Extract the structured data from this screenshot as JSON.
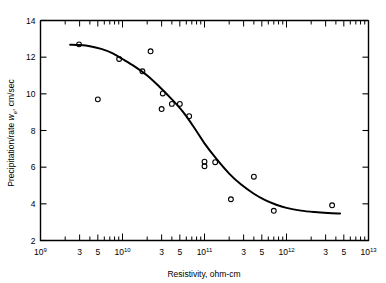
{
  "chart_data": {
    "type": "scatter",
    "title": "",
    "xlabel": "Resistivity, ohm-cm",
    "ylabel_prefix": "Precipitation/rate ",
    "ylabel_symbol": "w",
    "ylabel_subscript": "e",
    "ylabel_suffix": ", cm/sec",
    "ylabel_full": "Precipitation/rate we, cm/sec",
    "xscale": "log",
    "yscale": "linear",
    "xlim": [
      1000000000,
      10000000000000
    ],
    "ylim": [
      2,
      14
    ],
    "grid": false,
    "legend": null,
    "x_decade_labels": [
      "10",
      "10",
      "10",
      "10",
      "10"
    ],
    "x_decade_exponents": [
      "9",
      "10",
      "11",
      "12",
      "13"
    ],
    "x_minor_labels": [
      "3",
      "5"
    ],
    "y_tick_labels": [
      "2",
      "4",
      "6",
      "8",
      "10",
      "12",
      "14"
    ],
    "y_ticks": [
      2,
      4,
      6,
      8,
      10,
      12,
      14
    ],
    "points": [
      {
        "x": 2950000000.0,
        "y": 12.7
      },
      {
        "x": 5000000000.0,
        "y": 9.7
      },
      {
        "x": 9100000000.0,
        "y": 11.9
      },
      {
        "x": 17500000000.0,
        "y": 11.23
      },
      {
        "x": 22000000000.0,
        "y": 12.32
      },
      {
        "x": 30000000000.0,
        "y": 9.17
      },
      {
        "x": 31000000000.0,
        "y": 10.02
      },
      {
        "x": 40000000000.0,
        "y": 9.45
      },
      {
        "x": 50000000000.0,
        "y": 9.45
      },
      {
        "x": 65000000000.0,
        "y": 8.78
      },
      {
        "x": 100000000000.0,
        "y": 6.05
      },
      {
        "x": 100000000000.0,
        "y": 6.3
      },
      {
        "x": 135000000000.0,
        "y": 6.27
      },
      {
        "x": 210000000000.0,
        "y": 4.25
      },
      {
        "x": 400000000000.0,
        "y": 5.48
      },
      {
        "x": 700000000000.0,
        "y": 3.62
      },
      {
        "x": 3600000000000.0,
        "y": 3.92
      }
    ],
    "fit_curve": [
      {
        "x": 2300000000.0,
        "y": 12.68
      },
      {
        "x": 3000000000.0,
        "y": 12.66
      },
      {
        "x": 4000000000.0,
        "y": 12.6
      },
      {
        "x": 5500000000.0,
        "y": 12.45
      },
      {
        "x": 7500000000.0,
        "y": 12.22
      },
      {
        "x": 10000000000.0,
        "y": 11.9
      },
      {
        "x": 14000000000.0,
        "y": 11.5
      },
      {
        "x": 20000000000.0,
        "y": 11.0
      },
      {
        "x": 28000000000.0,
        "y": 10.4
      },
      {
        "x": 40000000000.0,
        "y": 9.7
      },
      {
        "x": 55000000000.0,
        "y": 9.0
      },
      {
        "x": 75000000000.0,
        "y": 8.15
      },
      {
        "x": 100000000000.0,
        "y": 7.3
      },
      {
        "x": 140000000000.0,
        "y": 6.45
      },
      {
        "x": 200000000000.0,
        "y": 5.65
      },
      {
        "x": 280000000000.0,
        "y": 5.05
      },
      {
        "x": 400000000000.0,
        "y": 4.55
      },
      {
        "x": 550000000000.0,
        "y": 4.2
      },
      {
        "x": 750000000000.0,
        "y": 3.95
      },
      {
        "x": 1000000000000.0,
        "y": 3.78
      },
      {
        "x": 1500000000000.0,
        "y": 3.63
      },
      {
        "x": 2200000000000.0,
        "y": 3.55
      },
      {
        "x": 3200000000000.0,
        "y": 3.5
      },
      {
        "x": 4500000000000.0,
        "y": 3.47
      }
    ]
  }
}
